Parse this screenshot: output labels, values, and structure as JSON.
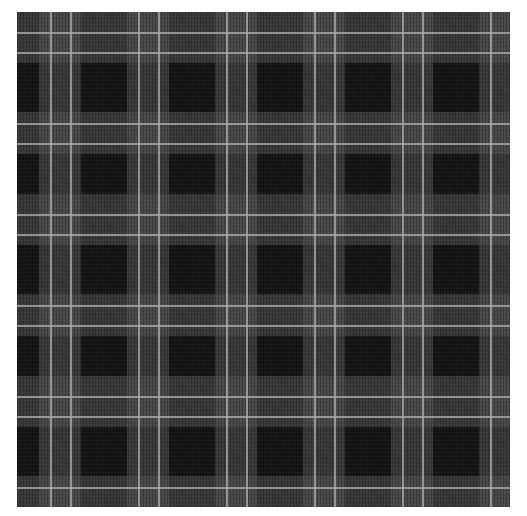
{
  "image": {
    "description": "Black, charcoal and grey tartan plaid fabric swatch with thin light-grey pinstripe pairs",
    "colors": {
      "background": "#ffffff",
      "dark_base": "#121212",
      "grey_band": "#4b4b4b",
      "pinstripe": "#9a9a9a"
    },
    "pattern": {
      "vertical_line_pairs_x": [
        51,
        71,
        137,
        157,
        226,
        246,
        317,
        337,
        405,
        425,
        493
      ],
      "horizontal_line_pairs_y": [
        33,
        53,
        124,
        144,
        214,
        234,
        305,
        325,
        397,
        417,
        485
      ],
      "repeat_x_px": 88,
      "repeat_y_px": 91
    },
    "alt_text": "Grey tartan plaid fabric"
  }
}
